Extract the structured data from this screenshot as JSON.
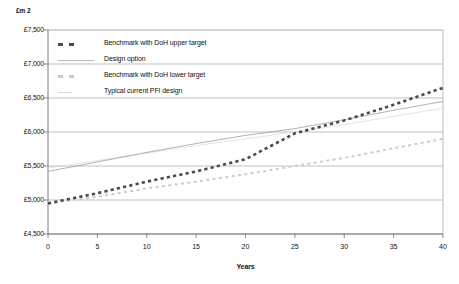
{
  "chart_data": {
    "type": "line",
    "title": "",
    "unit_label": "£m 2",
    "xlabel": "Years",
    "ylabel": "",
    "xlim": [
      0,
      40
    ],
    "ylim": [
      4500,
      7500
    ],
    "xticks": [
      "0",
      "5",
      "10",
      "15",
      "20",
      "25",
      "30",
      "35",
      "40"
    ],
    "xtick_values": [
      0,
      5,
      10,
      15,
      20,
      25,
      30,
      35,
      40
    ],
    "yticks": [
      "£7,500",
      "£7,000",
      "£6,500",
      "£6,000",
      "£5,500",
      "£5,000",
      "£4,500"
    ],
    "ytick_values": [
      7500,
      7000,
      6500,
      6000,
      5500,
      5000,
      4500
    ],
    "grid": true,
    "grid_axis": "y",
    "legend_position": "upper-left-inside",
    "x": [
      0,
      5,
      10,
      15,
      20,
      25,
      30,
      35,
      40
    ],
    "series": [
      {
        "name": "Benchmark with DoH upper target",
        "style": "dashed-thick",
        "color": "#4a4a4a",
        "values": [
          4950,
          5100,
          5270,
          5420,
          5600,
          5980,
          6170,
          6400,
          6650
        ]
      },
      {
        "name": "Design option",
        "style": "solid-thin",
        "color": "#9a9a9a",
        "values": [
          5420,
          5560,
          5700,
          5830,
          5950,
          6050,
          6180,
          6320,
          6450
        ]
      },
      {
        "name": "Benchmark with DoH lower target",
        "style": "dashed-light",
        "color": "#cccccc",
        "values": [
          4950,
          5050,
          5170,
          5270,
          5380,
          5500,
          5620,
          5760,
          5900
        ]
      },
      {
        "name": "Typical current PFI design",
        "style": "solid-faint",
        "color": "#dcdcdc",
        "values": [
          5470,
          5580,
          5690,
          5800,
          5900,
          6000,
          6110,
          6230,
          6350
        ]
      }
    ],
    "annotations": [
      {
        "text": "upper benchmark crosses design option near year 25"
      }
    ]
  },
  "legend": {
    "items": [
      {
        "label": "Benchmark with DoH upper target",
        "swatch": "dashed-dark-icon"
      },
      {
        "label": "Design option",
        "swatch": "solid-thin-icon"
      },
      {
        "label": "Benchmark with DoH lower target",
        "swatch": "dashed-light-icon"
      },
      {
        "label": "Typical current PFI design",
        "swatch": "solid-faint-icon"
      }
    ]
  }
}
